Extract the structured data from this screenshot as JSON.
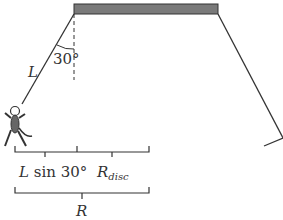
{
  "diagram": {
    "labels": {
      "rope_length": "L",
      "angle": "30°",
      "horizontal_offset_prefix": "L",
      "horizontal_offset_suffix": " sin 30°",
      "disc_radius_main": "R",
      "disc_radius_sub": "disc",
      "total_radius": "R"
    },
    "colors": {
      "disc_fill": "#7a7a7a",
      "line": "#333333",
      "figure_fill": "#666666"
    }
  }
}
